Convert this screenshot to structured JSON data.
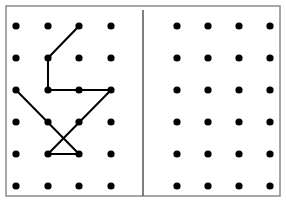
{
  "diagram": {
    "colors": {
      "dot": "#000000",
      "line": "#000000",
      "frame": "#8a8a8a",
      "divider": "#555555",
      "background": "#ffffff"
    },
    "grids": [
      {
        "name": "left-grid",
        "columns": 4,
        "rows": 6,
        "segments": [
          {
            "from": [
              2,
              0
            ],
            "to": [
              1,
              1
            ]
          },
          {
            "from": [
              1,
              1
            ],
            "to": [
              1,
              2
            ]
          },
          {
            "from": [
              1,
              2
            ],
            "to": [
              3,
              2
            ]
          },
          {
            "from": [
              0,
              2
            ],
            "to": [
              2,
              4
            ]
          },
          {
            "from": [
              3,
              2
            ],
            "to": [
              1,
              4
            ]
          },
          {
            "from": [
              1,
              4
            ],
            "to": [
              2,
              4
            ]
          }
        ]
      },
      {
        "name": "right-grid",
        "columns": 4,
        "rows": 6,
        "segments": []
      }
    ]
  }
}
